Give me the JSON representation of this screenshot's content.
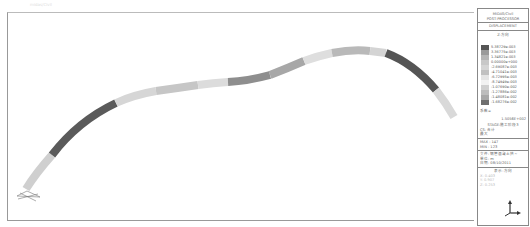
{
  "header": {
    "faint_title": "midas/Civil"
  },
  "legend": {
    "program": "MIDAS/Civil",
    "module": "POST-PROCESSOR",
    "result_type": "DISPLACEMENT",
    "component": "Z-方向",
    "scale": [
      {
        "value": "5.38729e-003",
        "color": "#555555"
      },
      {
        "value": "3.36775e-003",
        "color": "#9a9a9a"
      },
      {
        "value": "1.34821e-003",
        "color": "#b5b5b5"
      },
      {
        "value": "0.00000e+000",
        "color": "#c8c8c8"
      },
      {
        "value": "-2.69087e-003",
        "color": "#d5d5d5"
      },
      {
        "value": "-4.71041e-003",
        "color": "#c0c0c0"
      },
      {
        "value": "-6.72995e-003",
        "color": "#e4e4e4"
      },
      {
        "value": "-8.74949e-003",
        "color": "#f2f2f2"
      },
      {
        "value": "-1.07690e-002",
        "color": "#d0d0d0"
      },
      {
        "value": "-1.27886e-002",
        "color": "#bdbdbd"
      },
      {
        "value": "-1.48081e-002",
        "color": "#a8a8a8"
      },
      {
        "value": "-1.68276e-002",
        "color": "#6e6e6e"
      }
    ],
    "factor_label": "系数=",
    "factor_value": "1.5056E+002",
    "stage": "STAGE:施工阶段3",
    "cs": "CS: 合计",
    "extra": "最大",
    "max": "MAX : 147",
    "min": "MIN : 123",
    "file": "文件: 钢管混凝土拱~",
    "unit": "单位: m",
    "date": "日期: 08/10/2011",
    "view_dir": "表示-方向",
    "x_val": "X: 0.403",
    "y_val": "Y: 0.907",
    "z_val": "Z: 0.253"
  },
  "model": {
    "segments_top": [
      "#c4c4c4",
      "#d8d8d8",
      "#bbbbbb",
      "#cfcfcf",
      "#9c9c9c",
      "#8d8d8d",
      "#c2c2c2",
      "#e0e0e0",
      "#cccccc",
      "#bfbfbf",
      "#a9a9a9",
      "#5f5f5f",
      "#d0d0d0"
    ]
  }
}
